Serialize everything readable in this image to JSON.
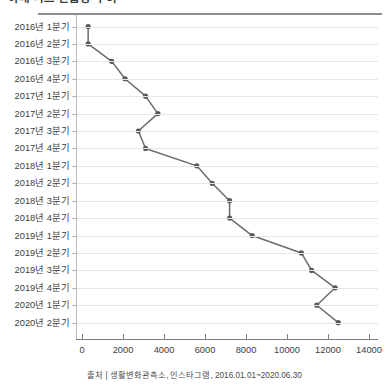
{
  "title": "아내 리즈 언급량 추이",
  "source": "출처 | 생활변화관측소, 인스타그램, 2016.01.01~2020.06.30",
  "colors": {
    "line": "#6b6b6b",
    "marker": "#595959",
    "grid": "#e6e6e6",
    "axis": "#7d7d7d",
    "rule": "#8d8d8d",
    "text": "#3d3d3d"
  },
  "chart_data": {
    "type": "line",
    "orientation": "horizontal",
    "title": "아내 리즈 언급량 추이",
    "xlabel": "",
    "ylabel": "",
    "xlim": [
      0,
      14000
    ],
    "xticks": [
      0,
      2000,
      4000,
      6000,
      8000,
      10000,
      12000,
      14000
    ],
    "xtick_labels": [
      "0",
      "2000",
      "4000",
      "6000",
      "8000",
      "10000",
      "12000",
      "14000"
    ],
    "grid": true,
    "legend": false,
    "categories": [
      "2016년 1분기",
      "2016년 2분기",
      "2016년 3분기",
      "2016년 4분기",
      "2017년 1분기",
      "2017년 2분기",
      "2017년 3분기",
      "2017년 4분기",
      "2018년 1분기",
      "2018년 2분기",
      "2018년 3분기",
      "2018년 4분기",
      "2019년 1분기",
      "2019년 2분기",
      "2019년 3분기",
      "2019년 4분기",
      "2020년 1분기",
      "2020년 2분기"
    ],
    "values": [
      300,
      300,
      1450,
      2100,
      3100,
      3700,
      2750,
      3100,
      5600,
      6350,
      7200,
      7200,
      8300,
      10700,
      11200,
      12350,
      11450,
      12500
    ]
  }
}
